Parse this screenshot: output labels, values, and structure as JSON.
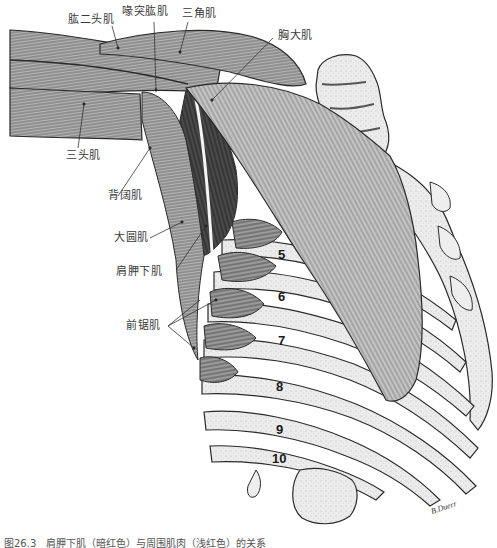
{
  "figure": {
    "caption": "图26.3　肩胛下肌（暗红色）与周围肌肉（浅红色）的关系",
    "signature": "B.Duerr",
    "labels": [
      {
        "id": "biceps",
        "text": "肱二头肌"
      },
      {
        "id": "coracobrachialis",
        "text": "喙突肱肌"
      },
      {
        "id": "deltoid",
        "text": "三角肌"
      },
      {
        "id": "pectoralis-major",
        "text": "胸大肌"
      },
      {
        "id": "triceps",
        "text": "三头肌"
      },
      {
        "id": "latissimus-dorsi",
        "text": "背阔肌"
      },
      {
        "id": "teres-major",
        "text": "大圆肌"
      },
      {
        "id": "subscapularis",
        "text": "肩胛下肌"
      },
      {
        "id": "serratus-anterior",
        "text": "前锯肌"
      }
    ],
    "rib_numbers": [
      "5",
      "6",
      "7",
      "8",
      "9",
      "10"
    ],
    "colors": {
      "line_art": "#2a2a2a",
      "muscle_shade": "#8a8a8a",
      "muscle_dark": "#3c3c3c",
      "bone": "#e6e6e6",
      "label_text": "#3a3a3a",
      "background": "#ffffff"
    }
  }
}
